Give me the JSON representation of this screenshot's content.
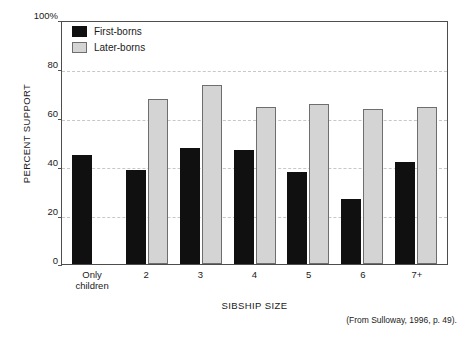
{
  "chart_data": {
    "type": "bar",
    "title": "",
    "xlabel": "SIBSHIP SIZE",
    "ylabel": "PERCENT SUPPORT",
    "categories": [
      "Only children",
      "2",
      "3",
      "4",
      "5",
      "6",
      "7+"
    ],
    "category_lines": [
      [
        "Only",
        "children"
      ],
      [
        "2"
      ],
      [
        "3"
      ],
      [
        "4"
      ],
      [
        "5"
      ],
      [
        "6"
      ],
      [
        "7+"
      ]
    ],
    "series": [
      {
        "name": "First-borns",
        "color": "#101010",
        "values": [
          45,
          39,
          48,
          47,
          38,
          27,
          42
        ]
      },
      {
        "name": "Later-borns",
        "color": "#d4d4d4",
        "values": [
          null,
          68,
          74,
          65,
          66,
          64,
          65
        ]
      }
    ],
    "ylim": [
      0,
      100
    ],
    "yticks": [
      0,
      20,
      40,
      60,
      80,
      100
    ],
    "ytick_labels": [
      "0",
      "20",
      "40",
      "60",
      "80",
      "100%"
    ],
    "grid": "horizontal-dashed",
    "legend_position": "top-left",
    "source_note": "(From Sulloway, 1996, p. 49)."
  }
}
